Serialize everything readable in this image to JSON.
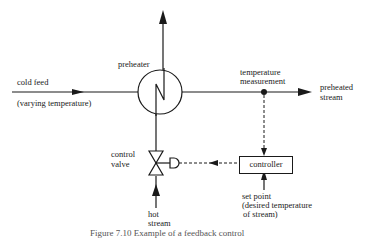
{
  "diagram": {
    "labels": {
      "cold_feed": "cold feed",
      "varying_temperature": "(varying temperature)",
      "preheater": "preheater",
      "temperature_measurement_1": "temperature",
      "temperature_measurement_2": "measurement",
      "preheated_stream_1": "preheated",
      "preheated_stream_2": "stream",
      "control_valve_1": "control",
      "control_valve_2": "valve",
      "controller": "controller",
      "hot_stream_1": "hot",
      "hot_stream_2": "stream",
      "set_point_1": "set point",
      "set_point_2": "(desired temperature",
      "set_point_3": "of stream)"
    },
    "caption": "Figure 7.10  Example of a feedback control"
  }
}
